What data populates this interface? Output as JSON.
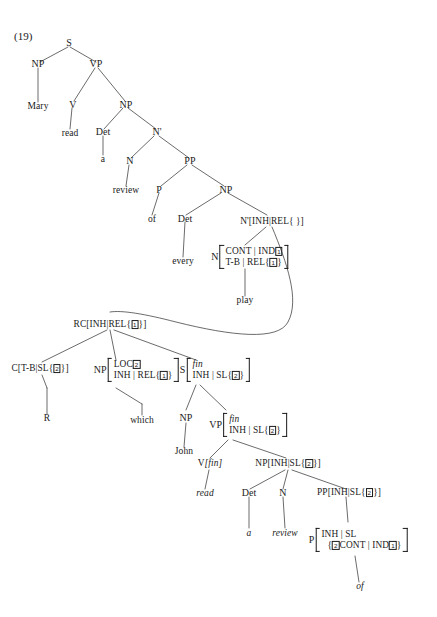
{
  "figure": {
    "number": "(19)",
    "type": "hpsg-syntax-tree"
  },
  "nodes": {
    "s_root": "S",
    "np_subj": "NP",
    "vp1": "VP",
    "v1": "V",
    "np_obj": "NP",
    "det1": "Det",
    "nbar1": "N'",
    "n1": "N",
    "pp1": "PP",
    "p1": "P",
    "np2": "NP",
    "det2": "Det",
    "nbar_rel_cat": "N'",
    "nbar_rel_feat": "[INH|REL{ }]",
    "n_quant_cat": "N",
    "n_quant_rows": [
      "CONT | IND",
      "T-B | REL{",
      "}"
    ],
    "rc_cat": "RC",
    "rc_feat_pre": "[INH|REL{",
    "rc_feat_post": "}]",
    "c_cat": "C",
    "c_feat_pre": "[T-B|SL{",
    "c_feat_post": "}]",
    "np_which_cat": "NP",
    "np_which_rows": [
      "LOC",
      "INH | REL{",
      "}"
    ],
    "s_fin_cat": "S",
    "s_fin_row1": "fin",
    "s_fin_row2_pre": "INH | SL{",
    "s_fin_row2_post": "}",
    "np_john": "NP",
    "vp_fin_cat": "VP",
    "vp_fin_row1": "fin",
    "vp_fin_row2_pre": "INH | SL{",
    "vp_fin_row2_post": "}",
    "v_fin_cat": "V",
    "v_fin_feat": "[fin]",
    "np_sl_cat": "NP",
    "np_sl_pre": "[INH|SL{",
    "np_sl_post": "}]",
    "det3": "Det",
    "n3": "N",
    "pp_sl_cat": "PP",
    "pp_sl_pre": "[INH|SL{",
    "pp_sl_post": "}]",
    "p_of_cat": "P",
    "p_of_row1": "INH | SL",
    "p_of_row2_pre": "{",
    "p_of_row2_mid": "CONT | IND",
    "p_of_row2_post": "}"
  },
  "tags": {
    "one": "1",
    "two": "2"
  },
  "terminals": {
    "mary": "Mary",
    "read1": "read",
    "a1": "a",
    "review1": "review",
    "of1": "of",
    "every": "every",
    "play": "play",
    "r_gap": "R",
    "which": "which",
    "john": "John",
    "read2": "read",
    "a2": "a",
    "review2": "review",
    "of2": "of"
  }
}
